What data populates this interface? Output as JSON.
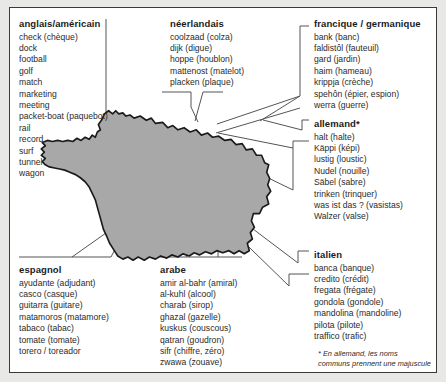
{
  "figure": {
    "map_region": "France",
    "map_fill_color": "#a8a8a8",
    "map_stroke_color": "#1a1a1a",
    "frame_border_color": "#3a3a3a",
    "page_background": "#e8e8e6",
    "connector_color": "#555555"
  },
  "blocks": {
    "anglais": {
      "header": "anglais/américain",
      "entries": [
        "check (chèque)",
        "dock",
        "football",
        "golf",
        "match",
        "marketing",
        "meeting",
        "packet-boat (paquebot)",
        "rail",
        "record",
        "surf",
        "tunnel",
        "wagon"
      ]
    },
    "neerlandais": {
      "header": "néerlandais",
      "entries": [
        "coolzaad (colza)",
        "dijk (digue)",
        "hoppe (houblon)",
        "mattenost (matelot)",
        "placken (plaque)"
      ]
    },
    "francique": {
      "header": "francique / germanique",
      "entries": [
        "bank (banc)",
        "faldistôl (fauteuil)",
        "gard (jardin)",
        "haim (hameau)",
        "krippja (crèche)",
        "spehôn (épier, espion)",
        "werra (guerre)"
      ]
    },
    "allemand": {
      "header": "allemand*",
      "entries": [
        "halt (halte)",
        "Käppi (képi)",
        "lustig (loustic)",
        "Nudel (nouille)",
        "Säbel (sabre)",
        "trinken (trinquer)",
        "was ist das ? (vasistas)",
        "Walzer (valse)"
      ]
    },
    "italien": {
      "header": "italien",
      "entries": [
        "banca (banque)",
        "credito (crédit)",
        "fregata (frégate)",
        "gondola (gondole)",
        "mandolina (mandoline)",
        "pilota (pilote)",
        "traffico (trafic)"
      ]
    },
    "espagnol": {
      "header": "espagnol",
      "entries": [
        "ayudante (adjudant)",
        "casco (casque)",
        "guitarra (guitare)",
        "matamoros (matamore)",
        "tabaco (tabac)",
        "tomate (tomate)",
        "torero / toreador"
      ]
    },
    "arabe": {
      "header": "arabe",
      "entries": [
        "amir al-bahr (amiral)",
        "al-kuhl (alcool)",
        "charab (sirop)",
        "ghazal (gazelle)",
        "kuskus (couscous)",
        "qatran (goudron)",
        "sifr (chiffre, zéro)",
        "zwawa (zouave)"
      ]
    }
  },
  "footnote": {
    "line1": "* En allemand, les noms",
    "line2": "communs prennent une majuscule"
  }
}
